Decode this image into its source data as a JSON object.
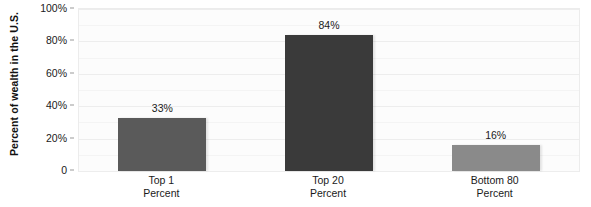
{
  "chart_data": {
    "type": "bar",
    "title": "",
    "xlabel": "",
    "ylabel": "Percent of wealth in the U.S.",
    "categories": [
      "Top 1 Percent",
      "Top 20 Percent",
      "Bottom 80 Percent"
    ],
    "category_lines": [
      [
        "Top 1",
        "Percent"
      ],
      [
        "Top 20",
        "Percent"
      ],
      [
        "Bottom 80",
        "Percent"
      ]
    ],
    "values": [
      33,
      84,
      16
    ],
    "value_labels": [
      "33%",
      "84%",
      "16%"
    ],
    "ylim": [
      0,
      100
    ],
    "ytick_values": [
      0,
      20,
      40,
      60,
      80,
      100
    ],
    "ytick_labels": [
      "0",
      "20%",
      "40%",
      "60%",
      "80%",
      "100%"
    ],
    "grid": true,
    "legend": "none",
    "bar_colors": [
      "#5a5a5a",
      "#3a3a3a",
      "#8a8a8a"
    ],
    "plot_background": "#fcfcfc",
    "gridline_color": "#ededed"
  }
}
